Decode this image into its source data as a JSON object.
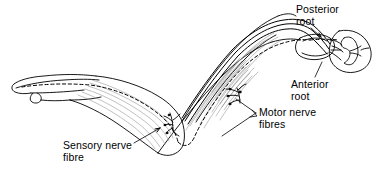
{
  "figure": {
    "background_color": "#ffffff",
    "line_color": "#000000",
    "shading_color": "#9a9a9a",
    "width": 376,
    "height": 187
  },
  "labels": {
    "posterior_root": "Posterior\nroot",
    "anterior_root": "Anterior\nroot",
    "motor_nerve_fibres": "Motor nerve\nfibres",
    "sensory_nerve_fibre": "Sensory nerve\nfibre"
  },
  "parts": {
    "hand": "hand-outline",
    "forearm": "forearm-outline",
    "upper_arm": "upper-arm-outline",
    "muscle_striations": "muscle-fibre-striations",
    "spinal_cord": "spinal-cord-cross-section",
    "grey_matter": "grey-matter-butterfly",
    "dorsal_root_ganglion": "dorsal-root-ganglion",
    "sensory_fibre_path": "dashed-sensory-nerve-fibre",
    "motor_fibre_path": "solid-motor-nerve-fibres",
    "motor_end_plate_forearm": "motor-end-plate-forearm",
    "motor_end_plate_upper_arm": "motor-end-plate-upper-arm"
  },
  "leader_lines": {
    "posterior_root": "leader-to-posterior-root",
    "anterior_root": "leader-to-anterior-root",
    "motor_nerve_fibres": "leader-to-motor-nerve-fibres",
    "sensory_nerve_fibre": "leader-to-sensory-nerve-fibre"
  }
}
